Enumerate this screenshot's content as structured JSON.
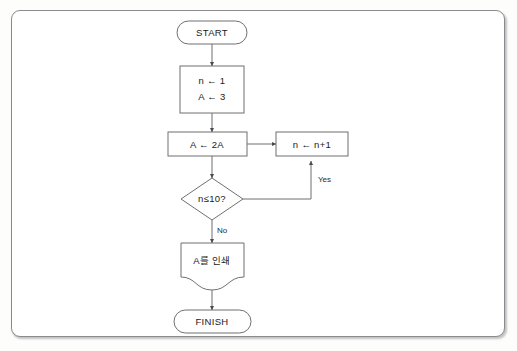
{
  "figure": {
    "kind": "flowchart",
    "language": "ko",
    "frame_border_color": "#8b8b8f",
    "shape_stroke_color": "#6f6f74",
    "shape_fill_color": "#ffffff",
    "text_color": "#1a1a1a",
    "background_color": "#ffffff"
  },
  "nodes": {
    "start": {
      "shape": "terminator",
      "label": "START"
    },
    "init": {
      "shape": "process",
      "line1": "n ← 1",
      "line2": "A ← 3"
    },
    "double": {
      "shape": "process",
      "label": "A ← 2A"
    },
    "increment": {
      "shape": "process",
      "label": "n ← n+1"
    },
    "decision": {
      "shape": "decision",
      "label": "n≤10?"
    },
    "print": {
      "shape": "document",
      "label": "A를 인쇄"
    },
    "finish": {
      "shape": "terminator",
      "label": "FINISH"
    }
  },
  "edges": {
    "start_to_init": {
      "label": ""
    },
    "init_to_double": {
      "label": ""
    },
    "double_to_increment": {
      "label": ""
    },
    "double_to_decision": {
      "label": ""
    },
    "decision_yes": {
      "label": "Yes"
    },
    "decision_no": {
      "label": "No"
    },
    "print_to_finish": {
      "label": ""
    }
  }
}
